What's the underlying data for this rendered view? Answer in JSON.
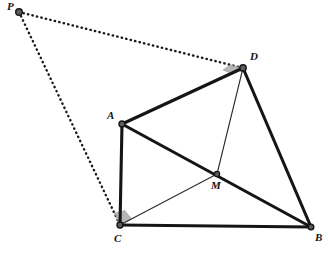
{
  "figure": {
    "background_color": "#ffffff",
    "stroke_color": "#151515",
    "thin_stroke_color": "#2a2a2a",
    "dotted_color": "#1a1a1a",
    "angle_marker_color": "#a8a8a8",
    "vertex_fill": "#5d5d5d",
    "vertex_stroke": "#151515"
  },
  "points": {
    "P": {
      "label": "P",
      "x": 19,
      "y": 12,
      "label_x": 7,
      "label_y": 1
    },
    "A": {
      "label": "A",
      "x": 122,
      "y": 124,
      "label_x": 107,
      "label_y": 110
    },
    "B": {
      "label": "B",
      "x": 311,
      "y": 227,
      "label_x": 315,
      "label_y": 232
    },
    "C": {
      "label": "C",
      "x": 120,
      "y": 225,
      "label_x": 114,
      "label_y": 233
    },
    "D": {
      "label": "D",
      "x": 243,
      "y": 68,
      "label_x": 250,
      "label_y": 51
    },
    "M": {
      "label": "M",
      "x": 217,
      "y": 174,
      "label_x": 211,
      "label_y": 180
    }
  },
  "segments": {
    "thick": [
      {
        "name": "segment-AD",
        "from": "A",
        "to": "D"
      },
      {
        "name": "segment-AC",
        "from": "A",
        "to": "C"
      },
      {
        "name": "segment-AB",
        "from": "A",
        "to": "B"
      },
      {
        "name": "segment-DB",
        "from": "D",
        "to": "B"
      },
      {
        "name": "segment-CB",
        "from": "C",
        "to": "B"
      }
    ],
    "thin": [
      {
        "name": "segment-CM",
        "from": "C",
        "to": "M"
      },
      {
        "name": "segment-MD",
        "from": "M",
        "to": "D"
      }
    ],
    "dotted": [
      {
        "name": "segment-PD",
        "from": "P",
        "to": "D"
      },
      {
        "name": "segment-PC",
        "from": "P",
        "to": "C"
      }
    ]
  },
  "angle_markers": [
    {
      "name": "right-angle-marker-D",
      "vertex": "D",
      "between": [
        "P",
        "A"
      ],
      "size": 13
    },
    {
      "name": "right-angle-marker-C",
      "vertex": "C",
      "between": [
        "P",
        "M"
      ],
      "size": 13
    }
  ],
  "labels": [
    "P",
    "A",
    "B",
    "C",
    "D",
    "M"
  ]
}
